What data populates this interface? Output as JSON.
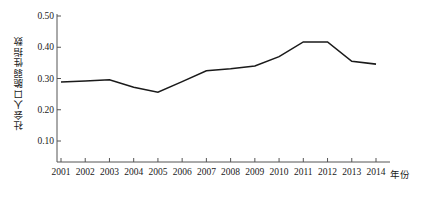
{
  "chart_data": {
    "type": "line",
    "title": "",
    "xlabel": "年份",
    "ylabel": "社会人口脆弱性指数",
    "categories": [
      "2001",
      "2002",
      "2003",
      "2004",
      "2005",
      "2006",
      "2007",
      "2008",
      "2009",
      "2010",
      "2011",
      "2012",
      "2013",
      "2014"
    ],
    "x": [
      2001,
      2002,
      2003,
      2004,
      2005,
      2006,
      2007,
      2008,
      2009,
      2010,
      2011,
      2012,
      2013,
      2014
    ],
    "values": [
      0.289,
      0.292,
      0.296,
      0.272,
      0.256,
      0.29,
      0.325,
      0.331,
      0.34,
      0.37,
      0.417,
      0.417,
      0.355,
      0.346
    ],
    "series": [
      {
        "name": "社会人口脆弱性指数",
        "values": [
          0.289,
          0.292,
          0.296,
          0.272,
          0.256,
          0.29,
          0.325,
          0.331,
          0.34,
          0.37,
          0.417,
          0.417,
          0.355,
          0.346
        ]
      }
    ],
    "ylim": [
      0.0,
      0.5
    ],
    "yticks": [
      0.1,
      0.2,
      0.3,
      0.4,
      0.5
    ],
    "ytick_labels": [
      "0.10",
      "0.20",
      "0.30",
      "0.40",
      "0.50"
    ],
    "xlim": [
      2000.5,
      2014.5
    ],
    "grid": false,
    "legend": null,
    "legend_position": "none",
    "line_color": "#1a1a1a",
    "markers": false,
    "axis_color": "#555555",
    "background": "#ffffff"
  },
  "axes": {
    "y_title": "社会人口脆弱性指数",
    "x_title": "年份"
  }
}
